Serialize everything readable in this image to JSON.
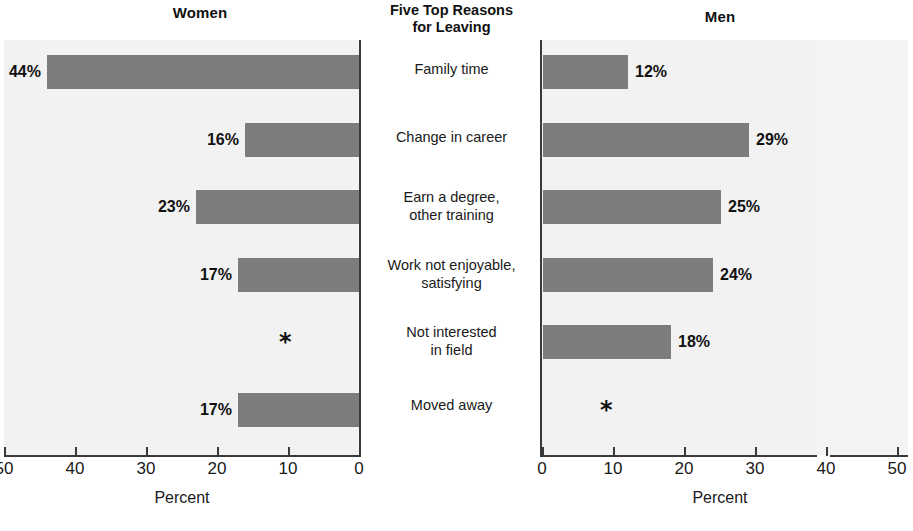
{
  "center": {
    "heading_line1": "Five Top Reasons",
    "heading_line2": "for Leaving",
    "labels": [
      {
        "line1": "Family time",
        "line2": ""
      },
      {
        "line1": "Change in career",
        "line2": ""
      },
      {
        "line1": "Earn a degree,",
        "line2": "other training"
      },
      {
        "line1": "Work not enjoyable,",
        "line2": "satisfying"
      },
      {
        "line1": "Not interested",
        "line2": "in field"
      },
      {
        "line1": "Moved away",
        "line2": ""
      }
    ]
  },
  "panels": {
    "women_title": "Women",
    "men_title": "Men",
    "axis_caption": "Percent"
  },
  "axis": {
    "women_ticks": [
      "50",
      "40",
      "30",
      "20",
      "10",
      "0"
    ],
    "men_ticks": [
      "0",
      "10",
      "20",
      "30",
      "40",
      "50"
    ]
  },
  "values": {
    "women_labels": [
      "44%",
      "16%",
      "23%",
      "17%",
      "*",
      "17%"
    ],
    "men_labels": [
      "12%",
      "29%",
      "25%",
      "24%",
      "18%",
      "*"
    ]
  },
  "colors": {
    "bar_fill": "#7d7d7d",
    "plot_background": "#f2f2f2",
    "axis": "#3a3a3a",
    "text": "#1a1a1a"
  },
  "chart_data": {
    "type": "bar",
    "title": "Five Top Reasons for Leaving",
    "orientation": "horizontal",
    "layout": "back-to-back population pyramid",
    "xlabel": "Percent",
    "ylabel": "",
    "grid": false,
    "legend": "none",
    "categories": [
      "Family time",
      "Change in career",
      "Earn a degree, other training",
      "Work not enjoyable, satisfying",
      "Not interested in field",
      "Moved away"
    ],
    "series": [
      {
        "name": "Women",
        "side": "left",
        "axis_direction": "right-to-left",
        "xlim": [
          0,
          50
        ],
        "tick_labels": [
          "50",
          "40",
          "30",
          "20",
          "10",
          "0"
        ],
        "values": [
          44,
          16,
          23,
          17,
          null,
          17
        ],
        "data_labels": [
          "44%",
          "16%",
          "23%",
          "17%",
          "*",
          "17%"
        ]
      },
      {
        "name": "Men",
        "side": "right",
        "axis_direction": "left-to-right",
        "xlim": [
          0,
          50
        ],
        "tick_labels": [
          "0",
          "10",
          "20",
          "30",
          "40",
          "50"
        ],
        "values": [
          12,
          29,
          25,
          24,
          18,
          null
        ],
        "data_labels": [
          "12%",
          "29%",
          "25%",
          "24%",
          "18%",
          "*"
        ]
      }
    ],
    "annotations": [
      {
        "text": "*",
        "series": "Women",
        "category": "Not interested in field",
        "meaning": "value suppressed / not reported"
      },
      {
        "text": "*",
        "series": "Men",
        "category": "Moved away",
        "meaning": "value suppressed / not reported"
      }
    ]
  }
}
